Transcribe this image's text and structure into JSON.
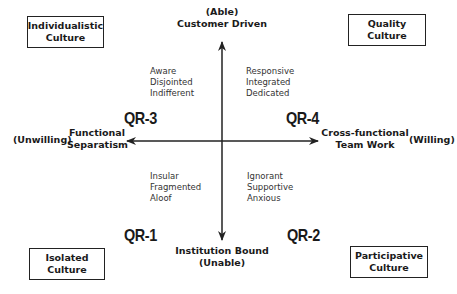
{
  "diagram": {
    "type": "quadrant",
    "axes": {
      "vertical": {
        "top": {
          "qualifier": "(Able)",
          "label": "Customer Driven"
        },
        "bottom": {
          "label": "Institution Bound",
          "qualifier": "(Unable)"
        }
      },
      "horizontal": {
        "left": {
          "qualifier": "(Unwilling)",
          "label_line1": "Functional",
          "label_line2": "Separatism"
        },
        "right": {
          "label_line1": "Cross-functional",
          "label_line2": "Team Work",
          "qualifier": "(Willing)"
        }
      }
    },
    "quadrants": {
      "top_left": {
        "id": "QR-3",
        "traits": [
          "Aware",
          "Disjointed",
          "Indifferent"
        ],
        "culture_line1": "Individualistic",
        "culture_line2": "Culture"
      },
      "top_right": {
        "id": "QR-4",
        "traits": [
          "Responsive",
          "Integrated",
          "Dedicated"
        ],
        "culture_line1": "Quality",
        "culture_line2": "Culture"
      },
      "bottom_left": {
        "id": "QR-1",
        "traits": [
          "Insular",
          "Fragmented",
          "Aloof"
        ],
        "culture_line1": "Isolated",
        "culture_line2": "Culture"
      },
      "bottom_right": {
        "id": "QR-2",
        "traits": [
          "Ignorant",
          "Supportive",
          "Anxious"
        ],
        "culture_line1": "Participative",
        "culture_line2": "Culture"
      }
    },
    "colors": {
      "line": "#222222",
      "text": "#1a1a1a",
      "background": "#ffffff"
    }
  }
}
